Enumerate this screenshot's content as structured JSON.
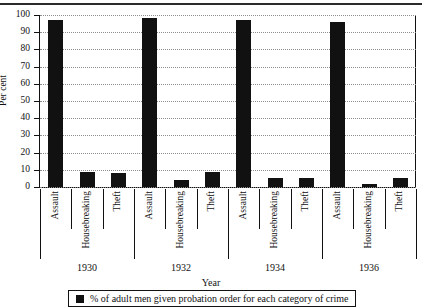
{
  "chart_data": {
    "type": "bar",
    "title": "",
    "xlabel": "Year",
    "ylabel": "Per cent",
    "ylim": [
      0,
      100
    ],
    "ytick_step": 10,
    "yticks": [
      0,
      10,
      20,
      30,
      40,
      50,
      60,
      70,
      80,
      90,
      100
    ],
    "grid": true,
    "legend_position": "bottom",
    "categories": [
      "Assault",
      "Housebreaking",
      "Theft"
    ],
    "groups": [
      "1930",
      "1932",
      "1934",
      "1936"
    ],
    "series": [
      {
        "name": "% of adult men given probation order for each category of crime",
        "color": "#111111",
        "points": [
          {
            "group": "1930",
            "category": "Assault",
            "value": 97
          },
          {
            "group": "1930",
            "category": "Housebreaking",
            "value": 9
          },
          {
            "group": "1930",
            "category": "Theft",
            "value": 8
          },
          {
            "group": "1932",
            "category": "Assault",
            "value": 98
          },
          {
            "group": "1932",
            "category": "Housebreaking",
            "value": 4
          },
          {
            "group": "1932",
            "category": "Theft",
            "value": 9
          },
          {
            "group": "1934",
            "category": "Assault",
            "value": 97
          },
          {
            "group": "1934",
            "category": "Housebreaking",
            "value": 5
          },
          {
            "group": "1934",
            "category": "Theft",
            "value": 5
          },
          {
            "group": "1936",
            "category": "Assault",
            "value": 96
          },
          {
            "group": "1936",
            "category": "Housebreaking",
            "value": 2
          },
          {
            "group": "1936",
            "category": "Theft",
            "value": 5
          }
        ]
      }
    ],
    "legend": [
      {
        "label": "% of adult men given probation order for each category of crime",
        "color": "#111111"
      }
    ]
  },
  "axis": {
    "y_label": "Per cent",
    "x_label": "Year",
    "y_tick_labels": [
      "100",
      "90",
      "80",
      "70",
      "60",
      "50",
      "40",
      "30",
      "20",
      "10",
      "0"
    ]
  },
  "category_labels": [
    "Assault",
    "Housebreaking",
    "Theft",
    "Assault",
    "Housebreaking",
    "Theft",
    "Assault",
    "Housebreaking",
    "Theft",
    "Assault",
    "Housebreaking",
    "Theft"
  ],
  "year_labels": [
    "1930",
    "1932",
    "1934",
    "1936"
  ],
  "legend": {
    "text": "% of adult men given probation order for each category of crime"
  }
}
